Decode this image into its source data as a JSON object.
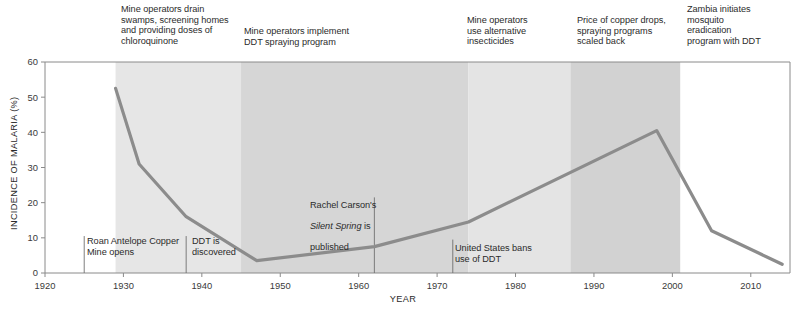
{
  "chart_data": {
    "type": "line",
    "title": "",
    "xlabel": "YEAR",
    "ylabel": "INCIDENCE OF MALARIA (%)",
    "xlim": [
      1920,
      2015
    ],
    "ylim": [
      0,
      60
    ],
    "grid": false,
    "legend": "none",
    "x_ticks": [
      "1920",
      "1930",
      "1940",
      "1950",
      "1960",
      "1970",
      "1980",
      "1990",
      "2000",
      "2010"
    ],
    "x_tick_values": [
      1920,
      1930,
      1940,
      1950,
      1960,
      1970,
      1980,
      1990,
      2000,
      2010
    ],
    "y_ticks": [
      "0",
      "10",
      "20",
      "30",
      "40",
      "50",
      "60"
    ],
    "y_tick_values": [
      0,
      10,
      20,
      30,
      40,
      50,
      60
    ],
    "series": [
      {
        "name": "Incidence of malaria",
        "color": "#8c8c8c",
        "x": [
          1929,
          1932,
          1938,
          1947,
          1962,
          1974,
          1998,
          2005,
          2014
        ],
        "values": [
          52.5,
          31.0,
          16.0,
          3.5,
          7.5,
          14.5,
          40.5,
          12.0,
          2.5
        ]
      }
    ],
    "bands": [
      {
        "name": "drainage-and-chloroquinone-era",
        "start": 1929,
        "end": 1945,
        "color": "#e6e6e6",
        "label": "Mine operators drain\nswamps, screening homes\nand providing doses of\nchloroquinone"
      },
      {
        "name": "ddt-spraying-era",
        "start": 1945,
        "end": 1974,
        "color": "#d6d6d6",
        "label": "Mine operators implement\nDDT spraying program"
      },
      {
        "name": "alternative-insecticides-era",
        "start": 1974,
        "end": 1987,
        "color": "#e4e4e4",
        "label": "Mine operators\nuse alternative\ninsecticides"
      },
      {
        "name": "copper-price-drop-era",
        "start": 1987,
        "end": 2001,
        "color": "#d2d2d2",
        "label": "Price of copper drops,\nspraying programs\nscaled back"
      },
      {
        "name": "zambia-eradication-era",
        "start": 2001,
        "end": 2015,
        "color": "#ffffff",
        "label": "Zambia initiates\nmosquito\neradication\nprogram with DDT"
      }
    ],
    "annotations": [
      {
        "name": "roan-antelope-mine",
        "year": 1925,
        "text": "Roan Antelope Copper\nMine opens",
        "line_top_pct": 10.5,
        "line_bottom_pct": 0
      },
      {
        "name": "ddt-discovered",
        "year": 1938,
        "text": "DDT is\ndiscovered",
        "line_top_pct": 10.5,
        "line_bottom_pct": 0
      },
      {
        "name": "rachel-carson-silent-spring",
        "year": 1962,
        "text_pre": "Rachel Carson's\n",
        "text_em": "Silent Spring",
        "text_post": " is\npublished",
        "line_top_pct": 21.5,
        "line_bottom_pct": 0
      },
      {
        "name": "united-states-bans-ddt",
        "year": 1972,
        "text": "United States bans\nuse of DDT",
        "line_top_pct": 9.5,
        "line_bottom_pct": 0
      }
    ]
  },
  "era_labels": {
    "band_0": "Mine operators drain\nswamps, screening homes\nand providing doses of\nchloroquinone",
    "band_1": "Mine operators implement\nDDT spraying program",
    "band_2": "Mine operators\nuse alternative\ninsecticides",
    "band_3": "Price of copper drops,\nspraying programs\nscaled back",
    "band_4": "Zambia initiates\nmosquito\neradication\nprogram with DDT"
  },
  "event_labels": {
    "roan_antelope": "Roan Antelope Copper\nMine opens",
    "ddt_discovered": "DDT is\ndiscovered",
    "carson_line1": "Rachel Carson's",
    "carson_em": "Silent Spring",
    "carson_tail": " is",
    "carson_line3": "published",
    "us_bans_ddt": "United States bans\nuse of DDT"
  },
  "axes": {
    "x_title": "YEAR",
    "y_title": "INCIDENCE OF MALARIA (%)"
  },
  "colors": {
    "line": "#8c8c8c",
    "axis": "#8a8a8a",
    "text": "#2b2b2b",
    "band_light": "#e6e6e6",
    "band_mid": "#e4e4e4",
    "band_dark": "#d6d6d6",
    "band_darker": "#d2d2d2"
  }
}
